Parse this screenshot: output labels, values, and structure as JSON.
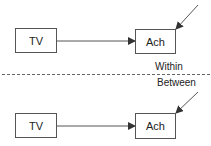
{
  "diagram": {
    "top": {
      "source": "TV",
      "target": "Ach",
      "label": "Within"
    },
    "bottom": {
      "source": "TV",
      "target": "Ach",
      "label": "Between"
    },
    "colors": {
      "stroke": "#555555",
      "text": "#222222",
      "background": "#ffffff"
    }
  }
}
